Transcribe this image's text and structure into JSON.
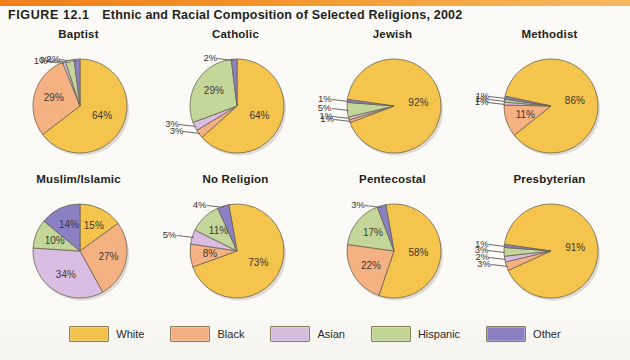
{
  "figure": {
    "number": "FIGURE 12.1",
    "title": "Ethnic and Racial Composition of Selected Religions, 2002"
  },
  "legend": {
    "items": [
      {
        "label": "White",
        "color": "#F5C44C"
      },
      {
        "label": "Black",
        "color": "#F6B183"
      },
      {
        "label": "Asian",
        "color": "#D9BDE3"
      },
      {
        "label": "Hispanic",
        "color": "#C3D79A"
      },
      {
        "label": "Other",
        "color": "#8B80C4"
      }
    ]
  },
  "bottom_fragment": "",
  "chart_data": [
    {
      "type": "pie",
      "title": "Baptist",
      "categories": [
        "White",
        "Black",
        "Asian",
        "Hispanic",
        "Other"
      ],
      "values": [
        64,
        29,
        1,
        3,
        2
      ],
      "labels": [
        "64%",
        "29%",
        "1%",
        "3%",
        "2%"
      ]
    },
    {
      "type": "pie",
      "title": "Catholic",
      "categories": [
        "White",
        "Black",
        "Asian",
        "Hispanic",
        "Other"
      ],
      "values": [
        64,
        3,
        3,
        29,
        2
      ],
      "labels": [
        "64%",
        "3%",
        "3%",
        "29%",
        "2%"
      ]
    },
    {
      "type": "pie",
      "title": "Jewish",
      "categories": [
        "White",
        "Black",
        "Asian",
        "Hispanic",
        "Other"
      ],
      "values": [
        92,
        1,
        1,
        5,
        1
      ],
      "labels": [
        "92%",
        "1%",
        "1%",
        "5%",
        "1%"
      ]
    },
    {
      "type": "pie",
      "title": "Methodist",
      "categories": [
        "White",
        "Black",
        "Asian",
        "Hispanic",
        "Other"
      ],
      "values": [
        86,
        11,
        1,
        1,
        1
      ],
      "labels": [
        "86%",
        "11%",
        "1%",
        "1%",
        "1%"
      ]
    },
    {
      "type": "pie",
      "title": "Muslim/Islamic",
      "categories": [
        "White",
        "Black",
        "Asian",
        "Hispanic",
        "Other"
      ],
      "values": [
        15,
        27,
        34,
        10,
        14
      ],
      "labels": [
        "15%",
        "27%",
        "34%",
        "10%",
        "14%"
      ]
    },
    {
      "type": "pie",
      "title": "No Religion",
      "categories": [
        "White",
        "Black",
        "Asian",
        "Hispanic",
        "Other"
      ],
      "values": [
        73,
        8,
        5,
        11,
        4
      ],
      "labels": [
        "73%",
        "8%",
        "5%",
        "11%",
        "4%"
      ]
    },
    {
      "type": "pie",
      "title": "Pentecostal",
      "categories": [
        "White",
        "Black",
        "Asian",
        "Hispanic",
        "Other"
      ],
      "values": [
        58,
        22,
        0,
        17,
        3
      ],
      "labels": [
        "58%",
        "22%",
        "",
        "17%",
        "3%"
      ]
    },
    {
      "type": "pie",
      "title": "Presbyterian",
      "categories": [
        "White",
        "Black",
        "Asian",
        "Hispanic",
        "Other"
      ],
      "values": [
        91,
        3,
        2,
        3,
        1
      ],
      "labels": [
        "91%",
        "3%",
        "2%",
        "3%",
        "1%"
      ]
    }
  ]
}
